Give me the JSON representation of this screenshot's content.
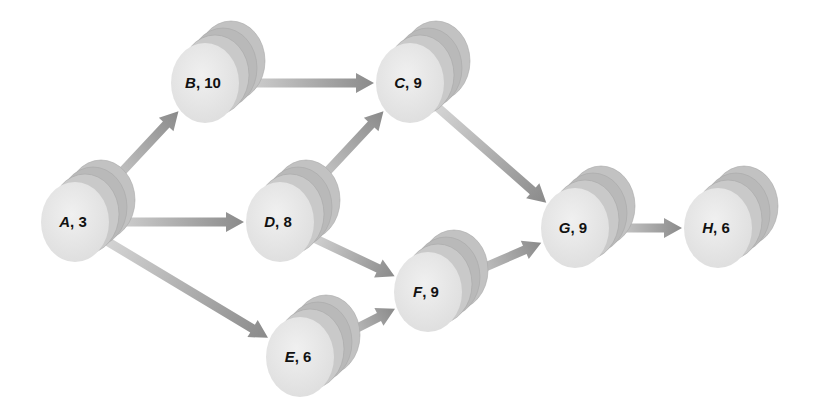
{
  "diagram": {
    "type": "activity-on-node network",
    "nodes": [
      {
        "id": "A",
        "letter": "A",
        "duration": "3",
        "x": 75,
        "y": 222
      },
      {
        "id": "B",
        "letter": "B",
        "duration": "10",
        "x": 205,
        "y": 83
      },
      {
        "id": "C",
        "letter": "C",
        "duration": "9",
        "x": 410,
        "y": 83
      },
      {
        "id": "D",
        "letter": "D",
        "duration": "8",
        "x": 280,
        "y": 222
      },
      {
        "id": "E",
        "letter": "E",
        "duration": "6",
        "x": 300,
        "y": 357
      },
      {
        "id": "F",
        "letter": "F",
        "duration": "9",
        "x": 428,
        "y": 292
      },
      {
        "id": "G",
        "letter": "G",
        "duration": "9",
        "x": 575,
        "y": 228
      },
      {
        "id": "H",
        "letter": "H",
        "duration": "6",
        "x": 718,
        "y": 228
      }
    ],
    "edges": [
      {
        "from": "A",
        "to": "B"
      },
      {
        "from": "A",
        "to": "D"
      },
      {
        "from": "A",
        "to": "E"
      },
      {
        "from": "B",
        "to": "C"
      },
      {
        "from": "D",
        "to": "C"
      },
      {
        "from": "D",
        "to": "F"
      },
      {
        "from": "E",
        "to": "F"
      },
      {
        "from": "C",
        "to": "G"
      },
      {
        "from": "F",
        "to": "G"
      },
      {
        "from": "G",
        "to": "H"
      }
    ],
    "colors": {
      "front_face": "#e6e6e6",
      "mid_disc": "#c4c4c4",
      "back_disc": "#b8b8b8",
      "arrow_light": "#d6d6d6",
      "arrow_dark": "#8a8a8a",
      "label": "#111111"
    }
  }
}
